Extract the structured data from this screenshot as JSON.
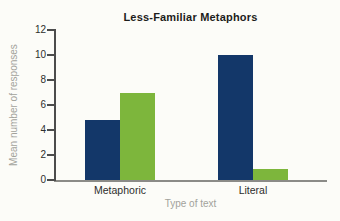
{
  "chart_data": {
    "type": "bar",
    "title": "Less-Familiar Metaphors",
    "xlabel": "Type of text",
    "ylabel": "Mean number of responses",
    "categories": [
      "Metaphoric",
      "Literal"
    ],
    "series": [
      {
        "name": "navy",
        "color": "#133769",
        "values": [
          4.8,
          10
        ]
      },
      {
        "name": "green",
        "color": "#7db63c",
        "values": [
          7,
          0.9
        ]
      }
    ],
    "ylim": [
      0,
      12
    ],
    "yticks": [
      0,
      2,
      4,
      6,
      8,
      10,
      12
    ],
    "grid": false,
    "legend": "none"
  },
  "colors": {
    "background": "#fcfcf8",
    "title_text": "#1d1d1b",
    "tick_text": "#2e2e2c",
    "muted_text": "#a2a29b",
    "axis": "#4c4c4c",
    "baseline": "#8b8b87"
  }
}
